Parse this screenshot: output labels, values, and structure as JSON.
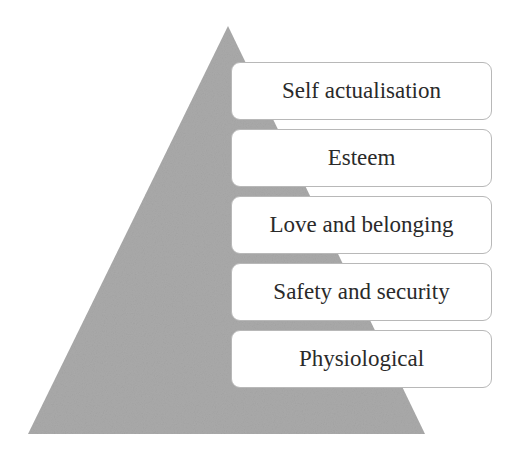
{
  "diagram": {
    "type": "pyramid",
    "shape_color": "#a9a9a9",
    "levels": [
      {
        "label": "Self actualisation"
      },
      {
        "label": "Esteem"
      },
      {
        "label": "Love and belonging"
      },
      {
        "label": "Safety and security"
      },
      {
        "label": "Physiological"
      }
    ]
  }
}
